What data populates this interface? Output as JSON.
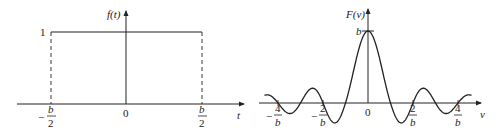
{
  "chart_data": [
    {
      "type": "line",
      "title": "",
      "ylabel": "f(t)",
      "xlabel": "t",
      "description": "Rectangular pulse of height 1 from -b/2 to b/2",
      "x_ticks": [
        {
          "label": "b/2",
          "sign": "-",
          "value": -0.5
        },
        {
          "label": "0",
          "sign": "",
          "value": 0
        },
        {
          "label": "b/2",
          "sign": "",
          "value": 0.5
        }
      ],
      "y_ticks": [
        {
          "label": "1",
          "value": 1
        }
      ],
      "x": [
        -0.5,
        -0.5,
        0.5,
        0.5
      ],
      "y": [
        0,
        1,
        1,
        0
      ],
      "dashed_edges": true,
      "grid": false
    },
    {
      "type": "line",
      "title": "",
      "ylabel": "F(v)",
      "xlabel": "v",
      "description": "Sinc function F(v) = b·sin(πbv)/(πbv), peak b at v=0",
      "x_ticks": [
        {
          "num": "4",
          "den": "b",
          "sign": "-",
          "value": -4
        },
        {
          "num": "2",
          "den": "b",
          "sign": "-",
          "value": -2
        },
        {
          "num": "0",
          "den": "",
          "sign": "",
          "value": 0
        },
        {
          "num": "2",
          "den": "b",
          "sign": "",
          "value": 2
        },
        {
          "num": "4",
          "den": "b",
          "sign": "",
          "value": 4
        }
      ],
      "y_ticks": [
        {
          "label": "b",
          "value": 1
        }
      ],
      "x_range_in_units_of_1_over_b": [
        -4.6,
        4.6
      ],
      "grid": false
    }
  ],
  "left": {
    "ylabel_f": "f",
    "ylabel_arg": "(t)",
    "xlabel": "t",
    "one": "1",
    "zero": "0",
    "minus": "−",
    "b": "b",
    "two": "2"
  },
  "right": {
    "ylabel_f": "F",
    "ylabel_arg": "(v)",
    "xlabel": "v",
    "peak": "b",
    "zero": "0",
    "minus": "−",
    "b": "b",
    "two": "2",
    "four": "4"
  }
}
